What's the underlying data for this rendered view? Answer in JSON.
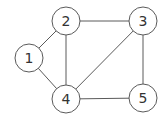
{
  "graph": {
    "type": "undirected",
    "node_radius": 14,
    "stroke_color": "#5a5a5a",
    "label_color": "#333333",
    "nodes": [
      {
        "id": "1",
        "label": "1",
        "x": 29,
        "y": 58
      },
      {
        "id": "2",
        "label": "2",
        "x": 66,
        "y": 21
      },
      {
        "id": "3",
        "label": "3",
        "x": 143,
        "y": 21
      },
      {
        "id": "4",
        "label": "4",
        "x": 66,
        "y": 99
      },
      {
        "id": "5",
        "label": "5",
        "x": 143,
        "y": 98
      }
    ],
    "edges": [
      {
        "from": "1",
        "to": "2"
      },
      {
        "from": "1",
        "to": "4"
      },
      {
        "from": "2",
        "to": "3"
      },
      {
        "from": "2",
        "to": "4"
      },
      {
        "from": "3",
        "to": "4"
      },
      {
        "from": "3",
        "to": "5"
      },
      {
        "from": "4",
        "to": "5"
      }
    ]
  }
}
